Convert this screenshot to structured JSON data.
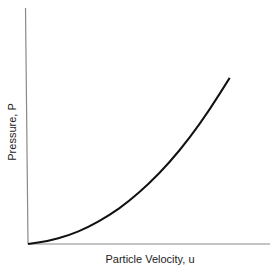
{
  "chart_data": {
    "type": "line",
    "title": "",
    "xlabel": "Particle Velocity, u",
    "ylabel": "Pressure, P",
    "grid": false,
    "legend": null,
    "axis_ticks": "none",
    "series": [
      {
        "name": "P-u Hugoniot",
        "x": [
          0.0,
          0.1,
          0.2,
          0.3,
          0.4,
          0.5,
          0.6,
          0.7,
          0.8,
          0.9,
          1.0
        ],
        "values": [
          0.0,
          0.015,
          0.045,
          0.09,
          0.15,
          0.225,
          0.32,
          0.43,
          0.56,
          0.71,
          0.88
        ]
      }
    ],
    "xlim": [
      0,
      1.2
    ],
    "ylim": [
      0,
      1.25
    ],
    "colors": {
      "curve": "#111111",
      "axis": "#777777"
    }
  }
}
